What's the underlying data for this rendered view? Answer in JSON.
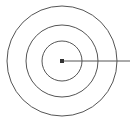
{
  "figure": {
    "width": 130,
    "height": 121,
    "background_color": "#ffffff"
  },
  "chart_data": {
    "type": "diagram",
    "subtype": "concentric-circles",
    "title": "",
    "xlabel": "",
    "ylabel": "",
    "center": {
      "x": 62,
      "y": 61
    },
    "stroke_color": "#555555",
    "stroke_width": 1,
    "rings": [
      {
        "name": "inner-circle",
        "radius": 20,
        "stroke": "#555555",
        "stroke_width": 1,
        "fill": "none"
      },
      {
        "name": "middle-circle",
        "radius": 36,
        "stroke": "#555555",
        "stroke_width": 1,
        "fill": "none"
      },
      {
        "name": "outer-circle",
        "radius": 55,
        "stroke": "#555555",
        "stroke_width": 1,
        "fill": "none"
      }
    ],
    "center_marker": {
      "name": "center-dot",
      "shape": "square",
      "size": 4,
      "fill": "#333333"
    },
    "pointer": {
      "name": "radial-pointer-line",
      "from": {
        "x": 62,
        "y": 61
      },
      "to": {
        "x": 130,
        "y": 61
      },
      "stroke": "#555555",
      "stroke_width": 1,
      "orientation": "horizontal-right",
      "label": ""
    },
    "annotations": [],
    "legend": [],
    "grid": false
  }
}
